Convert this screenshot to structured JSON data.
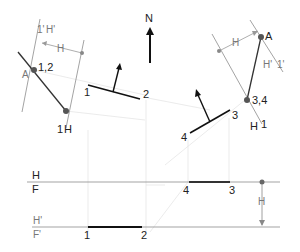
{
  "north": {
    "label": "N"
  },
  "left_view": {
    "labels": {
      "point_a": "A",
      "point_12": "1,2",
      "fold_top": "1'",
      "fold_top2": "H'",
      "dim_h": "H",
      "fold_bottom": "1",
      "fold_bottom2": "H"
    }
  },
  "right_view": {
    "labels": {
      "point_a": "A",
      "point_34": "3,4",
      "fold_top": "H'",
      "fold_top2": "1'",
      "dim_h": "H",
      "fold_bottom": "H",
      "fold_bottom2": "1"
    }
  },
  "top_view": {
    "edge_12": {
      "p1": "1",
      "p2": "2"
    },
    "edge_43": {
      "p1": "4",
      "p2": "3"
    }
  },
  "front_view": {
    "fold_line_hf": {
      "upper": "H",
      "lower": "F"
    },
    "fold_line_hf_prime": {
      "upper": "H'",
      "lower": "F'"
    },
    "edge_43": {
      "p1": "4",
      "p2": "3"
    },
    "edge_12": {
      "p1": "1",
      "p2": "2"
    },
    "dim_h": "H"
  },
  "colors": {
    "line": "#222222",
    "construction": "#d8d8d8",
    "fold": "#999999",
    "point": "#555555"
  }
}
